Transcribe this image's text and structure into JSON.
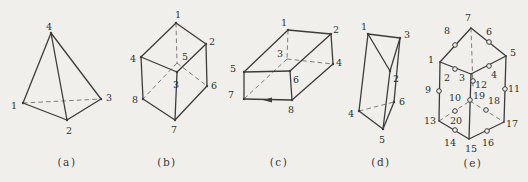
{
  "page": {
    "background": "#f0efeb",
    "ink": "#3c3c3c",
    "hidden_line": "#7d7d7d",
    "description_labels": [
      "(a)",
      "(b)",
      "(c)",
      "(d)",
      "(e)"
    ]
  },
  "figures": [
    {
      "name": "tetrahedron-a",
      "caption": "(a)",
      "caption_pos": [
        67,
        162
      ],
      "points": {
        "1": [
          23,
          103
        ],
        "2": [
          67,
          120
        ],
        "3": [
          101,
          99
        ],
        "4": [
          51,
          33
        ]
      },
      "solid_edges": [
        [
          "4",
          "1"
        ],
        [
          "4",
          "2"
        ],
        [
          "4",
          "3"
        ],
        [
          "1",
          "2"
        ],
        [
          "2",
          "3"
        ]
      ],
      "dashed_edges": [
        [
          "1",
          "3"
        ]
      ],
      "vertex_dots": [
        "1",
        "2",
        "3",
        "4"
      ],
      "circles": [],
      "labels": {
        "1": [
          14,
          106
        ],
        "2": [
          69,
          131
        ],
        "3": [
          109,
          98
        ],
        "4": [
          49,
          27
        ]
      }
    },
    {
      "name": "hexahedron-b",
      "caption": "(b)",
      "caption_pos": [
        167,
        162
      ],
      "points": {
        "1": [
          176,
          23
        ],
        "2": [
          206,
          44
        ],
        "3": [
          177,
          72
        ],
        "4": [
          141,
          57
        ],
        "5": [
          177,
          63
        ],
        "6": [
          207,
          86
        ],
        "7": [
          175,
          120
        ],
        "8": [
          143,
          99
        ]
      },
      "solid_edges": [
        [
          "1",
          "2"
        ],
        [
          "1",
          "4"
        ],
        [
          "4",
          "3"
        ],
        [
          "3",
          "2"
        ],
        [
          "4",
          "8"
        ],
        [
          "3",
          "7"
        ],
        [
          "2",
          "6"
        ],
        [
          "8",
          "7"
        ],
        [
          "7",
          "6"
        ]
      ],
      "dashed_edges": [
        [
          "1",
          "5"
        ],
        [
          "5",
          "8"
        ],
        [
          "5",
          "6"
        ]
      ],
      "vertex_dots": [
        "1",
        "2",
        "3",
        "4",
        "6",
        "7",
        "8"
      ],
      "circles": [],
      "labels": {
        "1": [
          178,
          15
        ],
        "2": [
          212,
          42
        ],
        "3": [
          176,
          85
        ],
        "4": [
          133,
          59
        ],
        "5": [
          185,
          57
        ],
        "6": [
          214,
          86
        ],
        "7": [
          174,
          130
        ],
        "8": [
          135,
          100
        ]
      }
    },
    {
      "name": "rectangular-prism-c",
      "caption": "(c)",
      "caption_pos": [
        279,
        162
      ],
      "points": {
        "1": [
          288,
          30
        ],
        "2": [
          331,
          34
        ],
        "3": [
          287,
          59
        ],
        "4": [
          333,
          64
        ],
        "5": [
          244,
          72
        ],
        "6": [
          290,
          71
        ],
        "7": [
          244,
          99
        ],
        "8": [
          292,
          100
        ]
      },
      "solid_edges": [
        [
          "5",
          "1"
        ],
        [
          "1",
          "2"
        ],
        [
          "2",
          "6"
        ],
        [
          "6",
          "5"
        ],
        [
          "5",
          "7"
        ],
        [
          "6",
          "8"
        ],
        [
          "7",
          "8"
        ],
        [
          "2",
          "4"
        ],
        [
          "4",
          "8"
        ]
      ],
      "dashed_edges": [
        [
          "1",
          "3"
        ],
        [
          "3",
          "4"
        ],
        [
          "3",
          "7"
        ]
      ],
      "vertex_dots": [
        "1",
        "2",
        "4",
        "5",
        "6",
        "7",
        "8"
      ],
      "arrow": {
        "tip": [
          263,
          100
        ],
        "tail": [
          272,
          100
        ]
      },
      "circles": [],
      "labels": {
        "1": [
          284,
          23
        ],
        "2": [
          336,
          30
        ],
        "3": [
          280,
          54
        ],
        "4": [
          339,
          63
        ],
        "5": [
          233,
          69
        ],
        "6": [
          296,
          80
        ],
        "7": [
          231,
          95
        ],
        "8": [
          291,
          110
        ]
      }
    },
    {
      "name": "triangular-prism-d",
      "caption": "(d)",
      "caption_pos": [
        381,
        162
      ],
      "points": {
        "1": [
          368,
          34
        ],
        "2": [
          390,
          71
        ],
        "3": [
          400,
          38
        ],
        "4": [
          359,
          111
        ],
        "5": [
          383,
          129
        ],
        "6": [
          394,
          102
        ]
      },
      "solid_edges": [
        [
          "1",
          "3"
        ],
        [
          "1",
          "2"
        ],
        [
          "3",
          "2"
        ],
        [
          "1",
          "4"
        ],
        [
          "2",
          "5"
        ],
        [
          "3",
          "6"
        ],
        [
          "4",
          "5"
        ],
        [
          "5",
          "6"
        ]
      ],
      "dashed_edges": [
        [
          "4",
          "6"
        ]
      ],
      "vertex_dots": [
        "1",
        "2",
        "3",
        "4",
        "5",
        "6"
      ],
      "circles": [],
      "labels": {
        "1": [
          364,
          27
        ],
        "2": [
          396,
          79
        ],
        "3": [
          407,
          35
        ],
        "4": [
          351,
          114
        ],
        "5": [
          382,
          140
        ],
        "6": [
          402,
          102
        ]
      }
    },
    {
      "name": "twenty-node-hexahedron-e",
      "caption": "(e)",
      "caption_pos": [
        473,
        163
      ],
      "points": {
        "1": [
          440,
          62
        ],
        "7": [
          471,
          28
        ],
        "5": [
          506,
          56
        ],
        "3": [
          471,
          74
        ],
        "13": [
          439,
          121
        ],
        "15": [
          469,
          139
        ],
        "17": [
          504,
          122
        ],
        "19": [
          470,
          101
        ],
        "8": [
          455,
          45
        ],
        "6": [
          489,
          42
        ],
        "2": [
          455,
          69
        ],
        "4": [
          489,
          66
        ],
        "9": [
          439,
          91
        ],
        "11": [
          505,
          89
        ],
        "12": [
          473,
          81
        ],
        "10": [
          470,
          100
        ],
        "14": [
          455,
          130
        ],
        "16": [
          487,
          131
        ],
        "20": [
          455,
          111
        ],
        "18": [
          486,
          110
        ],
        "hx": [
          473,
          88
        ]
      },
      "solid_edges": [
        [
          "1",
          "7"
        ],
        [
          "7",
          "5"
        ],
        [
          "1",
          "3"
        ],
        [
          "3",
          "5"
        ],
        [
          "1",
          "13"
        ],
        [
          "5",
          "17"
        ],
        [
          "3",
          "15"
        ],
        [
          "13",
          "15"
        ],
        [
          "15",
          "17"
        ]
      ],
      "dashed_edges": [
        [
          "7",
          "hx"
        ],
        [
          "13",
          "19"
        ],
        [
          "19",
          "17"
        ]
      ],
      "vertex_dots": [],
      "circles": [
        "8",
        "6",
        "2",
        "4",
        "9",
        "11",
        "12",
        "10",
        "14",
        "16",
        "20",
        "18"
      ],
      "labels": {
        "1": [
          431,
          60
        ],
        "2": [
          447,
          78
        ],
        "3": [
          462,
          78
        ],
        "4": [
          494,
          75
        ],
        "5": [
          513,
          53
        ],
        "6": [
          489,
          32
        ],
        "7": [
          468,
          18
        ],
        "8": [
          447,
          31
        ],
        "9": [
          428,
          90
        ],
        "10": [
          455,
          98
        ],
        "11": [
          514,
          89
        ],
        "12": [
          481,
          85
        ],
        "13": [
          430,
          121
        ],
        "14": [
          450,
          143
        ],
        "15": [
          471,
          149
        ],
        "16": [
          488,
          143
        ],
        "17": [
          512,
          124
        ],
        "18": [
          494,
          101
        ],
        "19": [
          479,
          96
        ],
        "20": [
          456,
          121
        ]
      }
    }
  ]
}
